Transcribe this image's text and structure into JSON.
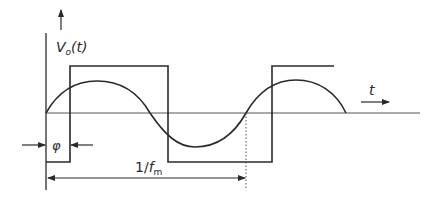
{
  "diagram": {
    "colors": {
      "stroke": "#2a2a2a",
      "axis": "#555555",
      "background": "#ffffff"
    },
    "y_axis_label": {
      "main": "V",
      "sub": "o",
      "arg": "(t)"
    },
    "t_axis_label": "t",
    "phase_label": "φ",
    "period_label": {
      "prefix": "1/",
      "main": "f",
      "sub": "m"
    }
  }
}
